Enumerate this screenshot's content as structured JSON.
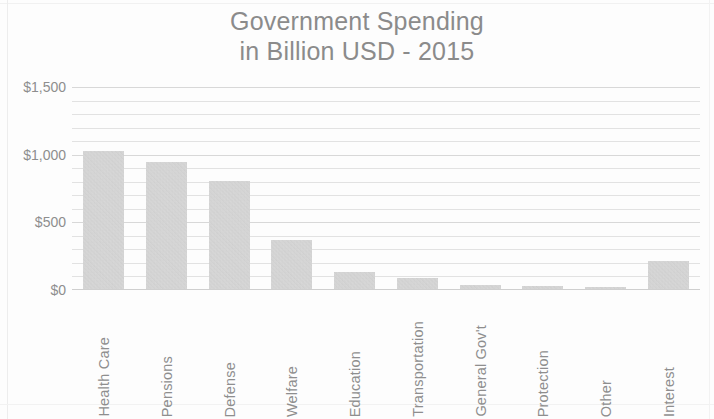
{
  "chart_data": {
    "type": "bar",
    "title": "Government Spending in Billion USD - 2015",
    "title_lines": [
      "Government Spending",
      "in Billion USD - 2015"
    ],
    "xlabel": "",
    "ylabel": "",
    "categories": [
      "Health Care",
      "Pensions",
      "Defense",
      "Welfare",
      "Education",
      "Transportation",
      "General Gov't",
      "Protection",
      "Other",
      "Interest"
    ],
    "values": [
      1020,
      940,
      800,
      360,
      125,
      80,
      30,
      20,
      10,
      210
    ],
    "ylim": [
      0,
      1500
    ],
    "ytick_values": [
      0,
      500,
      1000,
      1500
    ],
    "ytick_labels": [
      "$0",
      "$500",
      "$1,000",
      "$1,500"
    ],
    "minor_tick_step": 100,
    "grid": true,
    "legend": "none",
    "bar_color": "#c9c9c9",
    "text_color": "#8e8e8e",
    "gridline_color": "#e2e2e2",
    "background_color": "#fdfdfd"
  }
}
